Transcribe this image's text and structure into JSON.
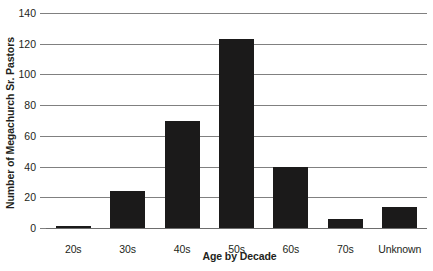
{
  "chart_data": {
    "type": "bar",
    "title": "",
    "subtitle": "",
    "xlabel": "Age by Decade",
    "ylabel": "Number of Megachurch Sr. Pastors",
    "categories": [
      "20s",
      "30s",
      "40s",
      "50s",
      "60s",
      "70s",
      "Unknown"
    ],
    "values": [
      1,
      24,
      70,
      123,
      40,
      6,
      14
    ],
    "series": [
      {
        "name": "Number of Megachurch Sr. Pastors",
        "values": [
          1,
          24,
          70,
          123,
          40,
          6,
          14
        ]
      }
    ],
    "ylim": [
      0,
      140
    ],
    "ytick_values": [
      0,
      20,
      40,
      60,
      80,
      100,
      120,
      140
    ],
    "ytick_labels": [
      "0",
      "20",
      "40",
      "60",
      "80",
      "100",
      "120",
      "140"
    ],
    "grid": "horizontal",
    "legend": "none",
    "bar_color": "#1b1a1a",
    "gridline_color": "#808080",
    "background_color": "#ffffff"
  },
  "axes": {
    "y_title": "Number of Megachurch Sr. Pastors",
    "x_title": "Age by Decade"
  }
}
